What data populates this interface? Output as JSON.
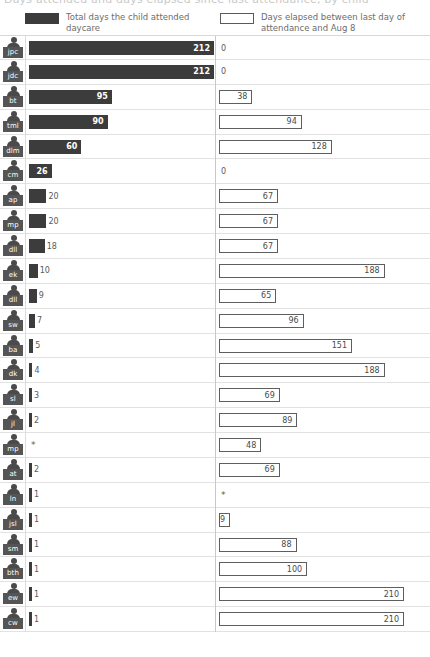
{
  "title_clipped": "Days attended and days elapsed since last attendance, by child",
  "legend": {
    "left": {
      "swatch": "filled-dark-swatch",
      "label": "Total days the child attended daycare"
    },
    "right": {
      "swatch": "hollow-outlined-swatch",
      "label": "Days elapsed between last day of attendance and Aug 8"
    }
  },
  "colors": {
    "bar_filled": "#3c3c3c",
    "bar_hollow_fill": "#ffffff",
    "bar_hollow_stroke": "#5e5e5e",
    "badge": "#555555",
    "gridline": "#e2e2e2",
    "text": "#5a5a5a"
  },
  "chart_data": {
    "type": "bar",
    "title": "Days attended and days elapsed since last attendance, by child",
    "orientation": "horizontal",
    "grid": true,
    "legend_position": "top",
    "categories": [
      "jpc",
      "jdc",
      "bt",
      "tml",
      "dlm",
      "cm",
      "ap",
      "mp",
      "dll",
      "ek",
      "dll",
      "sw",
      "ba",
      "dk",
      "sl",
      "jl",
      "mp",
      "at",
      "ln",
      "jsl",
      "sm",
      "bth",
      "ew",
      "cw"
    ],
    "xlabel": "",
    "ylabel": "",
    "series": [
      {
        "name": "Total days the child attended daycare",
        "style": "filled",
        "max": 212,
        "values": [
          212,
          212,
          95,
          90,
          60,
          26,
          20,
          20,
          18,
          10,
          9,
          7,
          5,
          4,
          3,
          2,
          "*",
          2,
          1,
          1,
          1,
          1,
          1,
          1
        ]
      },
      {
        "name": "Days elapsed between last day of attendance and Aug 8",
        "style": "hollow",
        "max": 210,
        "values": [
          0,
          0,
          38,
          94,
          128,
          0,
          67,
          67,
          67,
          188,
          65,
          96,
          151,
          188,
          69,
          89,
          48,
          69,
          "*",
          9,
          88,
          100,
          210,
          210
        ]
      }
    ]
  },
  "rows": [
    {
      "id": "jpc",
      "left": 212,
      "right": 0
    },
    {
      "id": "jdc",
      "left": 212,
      "right": 0
    },
    {
      "id": "bt",
      "left": 95,
      "right": 38
    },
    {
      "id": "tml",
      "left": 90,
      "right": 94
    },
    {
      "id": "dlm",
      "left": 60,
      "right": 128
    },
    {
      "id": "cm",
      "left": 26,
      "right": 0
    },
    {
      "id": "ap",
      "left": 20,
      "right": 67
    },
    {
      "id": "mp",
      "left": 20,
      "right": 67
    },
    {
      "id": "dll",
      "left": 18,
      "right": 67
    },
    {
      "id": "ek",
      "left": 10,
      "right": 188
    },
    {
      "id": "dll",
      "left": 9,
      "right": 65
    },
    {
      "id": "sw",
      "left": 7,
      "right": 96
    },
    {
      "id": "ba",
      "left": 5,
      "right": 151
    },
    {
      "id": "dk",
      "left": 4,
      "right": 188
    },
    {
      "id": "sl",
      "left": 3,
      "right": 69
    },
    {
      "id": "jl",
      "left": 2,
      "right": 89
    },
    {
      "id": "mp",
      "left": "*",
      "right": 48
    },
    {
      "id": "at",
      "left": 2,
      "right": 69
    },
    {
      "id": "ln",
      "left": 1,
      "right": "*"
    },
    {
      "id": "jsl",
      "left": 1,
      "right": 9
    },
    {
      "id": "sm",
      "left": 1,
      "right": 88
    },
    {
      "id": "bth",
      "left": 1,
      "right": 100
    },
    {
      "id": "ew",
      "left": 1,
      "right": 210
    },
    {
      "id": "cw",
      "left": 1,
      "right": 210
    }
  ]
}
